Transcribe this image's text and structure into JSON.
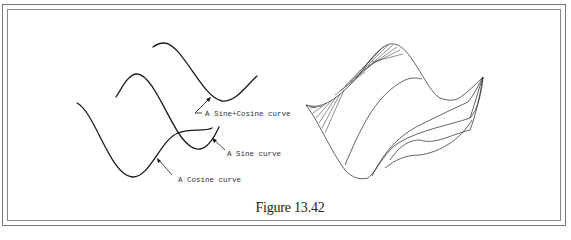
{
  "figure": {
    "caption": "Figure 13.42",
    "left_panel": {
      "labels": {
        "sine_cosine": "A Sine+Cosine curve",
        "sine": "A Sine curve",
        "cosine": "A Cosine curve"
      }
    },
    "right_panel": {
      "description": "3D wireframe surface swept from sine and cosine curves"
    },
    "colors": {
      "line": "#1a1a1a",
      "frame": "#777777",
      "background": "#ffffff"
    }
  }
}
